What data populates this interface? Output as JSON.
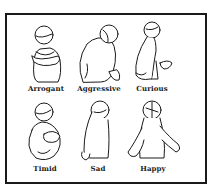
{
  "figures": [
    {
      "label": "Arrogant"
    },
    {
      "label": "Aggressive"
    },
    {
      "label": "Curious"
    },
    {
      "label": "Timid"
    },
    {
      "label": "Sad"
    },
    {
      "label": "Happy"
    }
  ],
  "colors": {
    "line": "#1a1a1a",
    "background": "#ffffff"
  }
}
